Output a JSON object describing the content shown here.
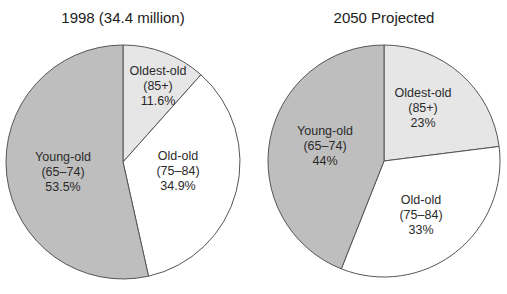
{
  "chart_data": [
    {
      "type": "pie",
      "title": "1998 (34.4 million)",
      "categories": [
        "Oldest-old (85+)",
        "Old-old (75–84)",
        "Young-old (65–74)"
      ],
      "values": [
        11.6,
        34.9,
        53.5
      ],
      "unit": "%",
      "colors": [
        "#e6e6e6",
        "#ffffff",
        "#bebebe"
      ],
      "labels": [
        {
          "name": "Oldest-old",
          "range": "(85+)",
          "pct": "11.6%"
        },
        {
          "name": "Old-old",
          "range": "(75–84)",
          "pct": "34.9%"
        },
        {
          "name": "Young-old",
          "range": "(65–74)",
          "pct": "53.5%"
        }
      ],
      "start_angle": "12 o'clock, clockwise"
    },
    {
      "type": "pie",
      "title": "2050 Projected",
      "categories": [
        "Oldest-old (85+)",
        "Old-old (75–84)",
        "Young-old (65–74)"
      ],
      "values": [
        23,
        33,
        44
      ],
      "unit": "%",
      "colors": [
        "#e6e6e6",
        "#ffffff",
        "#bebebe"
      ],
      "labels": [
        {
          "name": "Oldest-old",
          "range": "(85+)",
          "pct": "23%"
        },
        {
          "name": "Old-old",
          "range": "(75–84)",
          "pct": "33%"
        },
        {
          "name": "Young-old",
          "range": "(65–74)",
          "pct": "44%"
        }
      ],
      "start_angle": "12 o'clock, clockwise"
    }
  ]
}
